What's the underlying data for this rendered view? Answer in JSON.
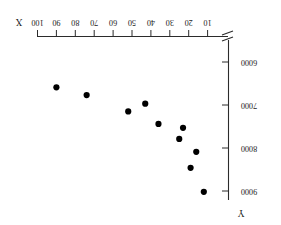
{
  "chart_data": {
    "type": "scatter",
    "title": "",
    "xlabel": "X",
    "ylabel": "Y",
    "orientation": "rotated-180",
    "grid": false,
    "legend": null,
    "xlim": [
      10,
      100
    ],
    "ylim": [
      6000,
      9000
    ],
    "x_axis_position": "top",
    "y_axis_position": "right",
    "x_axis_direction": "right-to-left",
    "y_axis_direction": "top-to-bottom",
    "axis_break": true,
    "xticks": [
      100,
      90,
      80,
      70,
      60,
      50,
      40,
      30,
      20,
      10
    ],
    "xtick_labels": [
      "100",
      "90",
      "80",
      "70",
      "60",
      "50",
      "40",
      "30",
      "20",
      "10"
    ],
    "yticks": [
      6000,
      7000,
      8000,
      9000
    ],
    "ytick_labels": [
      "6000",
      "7000",
      "8000",
      "9000"
    ],
    "points": [
      {
        "x": 90,
        "y": 6590
      },
      {
        "x": 74,
        "y": 6770
      },
      {
        "x": 52,
        "y": 7150
      },
      {
        "x": 43,
        "y": 6970
      },
      {
        "x": 36,
        "y": 7440
      },
      {
        "x": 23,
        "y": 7530
      },
      {
        "x": 25,
        "y": 7790
      },
      {
        "x": 16,
        "y": 8090
      },
      {
        "x": 19,
        "y": 8460
      },
      {
        "x": 12,
        "y": 9020
      }
    ],
    "marker": {
      "shape": "circle",
      "size": 3.1,
      "color": "#000000"
    }
  },
  "labels": {
    "x_axis_name": "X",
    "y_axis_name": "Y"
  }
}
